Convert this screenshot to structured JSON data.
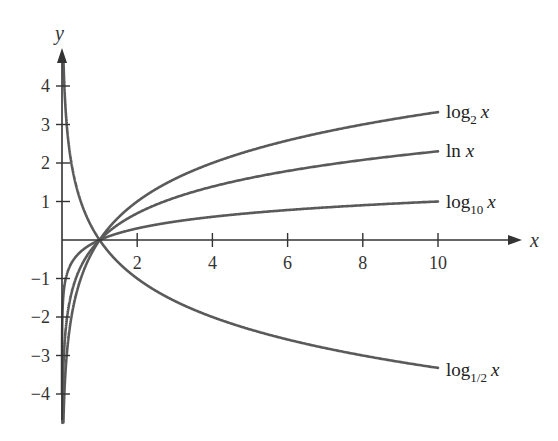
{
  "chart_data": {
    "type": "line",
    "title": "",
    "xlabel": "x",
    "ylabel": "y",
    "xlim": [
      0,
      10.5
    ],
    "ylim": [
      -4.5,
      4.5
    ],
    "grid": false,
    "legend_position": "inline-right",
    "x_ticks": [
      2,
      4,
      6,
      8,
      10
    ],
    "x_tick_labels": [
      "2",
      "4",
      "6",
      "8",
      "10"
    ],
    "y_ticks": [
      -4,
      -3,
      -2,
      -1,
      1,
      2,
      3,
      4
    ],
    "y_tick_labels": [
      "−4",
      "−3",
      "−2",
      "−1",
      "1",
      "2",
      "3",
      "4"
    ],
    "series": [
      {
        "name": "log_2 x",
        "label_main": "log",
        "label_sub": "2",
        "label_var": "x",
        "base": 2,
        "x": [
          0.0625,
          0.125,
          0.25,
          0.5,
          1,
          2,
          4,
          6,
          8,
          10
        ],
        "values": [
          -4,
          -3,
          -2,
          -1,
          0,
          1,
          2,
          2.58,
          3,
          3.32
        ]
      },
      {
        "name": "ln x",
        "label_main": "ln",
        "label_sub": "",
        "label_var": "x",
        "base": 2.718281828,
        "x": [
          0.0183,
          0.05,
          0.135,
          0.368,
          1,
          2,
          4,
          6,
          8,
          10
        ],
        "values": [
          -4,
          -3,
          -2,
          -1,
          0,
          0.69,
          1.39,
          1.79,
          2.08,
          2.3
        ]
      },
      {
        "name": "log_10 x",
        "label_main": "log",
        "label_sub": "10",
        "label_var": "x",
        "base": 10,
        "x": [
          0.0001,
          0.001,
          0.01,
          0.1,
          1,
          2,
          4,
          6,
          8,
          10
        ],
        "values": [
          -4,
          -3,
          -2,
          -1,
          0,
          0.3,
          0.6,
          0.78,
          0.9,
          1.0
        ]
      },
      {
        "name": "log_1/2 x",
        "label_main": "log",
        "label_sub": "1/2",
        "label_var": "x",
        "base": 0.5,
        "x": [
          0.0625,
          0.125,
          0.25,
          0.5,
          1,
          2,
          4,
          6,
          8,
          10
        ],
        "values": [
          4,
          3,
          2,
          1,
          0,
          -1,
          -2,
          -2.58,
          -3,
          -3.32
        ]
      }
    ],
    "annotations": [
      "All curves pass through (1, 0)"
    ]
  },
  "axes": {
    "x_label": "x",
    "y_label": "y"
  }
}
